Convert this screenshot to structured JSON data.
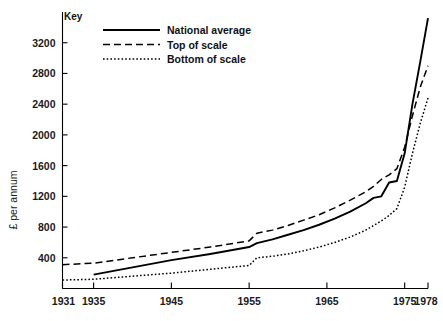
{
  "chart_data": {
    "type": "line",
    "title": "",
    "xlabel": "",
    "ylabel": "£ per annum",
    "xlim": [
      1931,
      1978
    ],
    "ylim": [
      0,
      3600
    ],
    "grid": false,
    "legend_title": "Key",
    "legend_position": "top-left-inside",
    "x_tick_labels": [
      "1931",
      "1935",
      "1945",
      "1955",
      "1965",
      "1975",
      "1978"
    ],
    "x_ticks": [
      1931,
      1935,
      1945,
      1955,
      1965,
      1975,
      1978
    ],
    "y_tick_labels": [
      "400",
      "800",
      "1200",
      "1600",
      "2000",
      "2400",
      "2800",
      "3200"
    ],
    "y_ticks": [
      400,
      800,
      1200,
      1600,
      2000,
      2400,
      2800,
      3200
    ],
    "series": [
      {
        "name": "National average",
        "style": "solid",
        "color": "#000000",
        "x": [
          1935,
          1940,
          1945,
          1950,
          1955,
          1956,
          1958,
          1960,
          1962,
          1964,
          1966,
          1968,
          1970,
          1971,
          1972,
          1973,
          1974,
          1975,
          1976,
          1977,
          1978
        ],
        "y": [
          180,
          275,
          370,
          450,
          540,
          590,
          640,
          700,
          760,
          830,
          910,
          1000,
          1110,
          1180,
          1200,
          1380,
          1400,
          1760,
          2400,
          2950,
          3520
        ]
      },
      {
        "name": "Top of scale",
        "style": "dashed",
        "color": "#000000",
        "x": [
          1931,
          1935,
          1940,
          1945,
          1950,
          1955,
          1956,
          1958,
          1960,
          1962,
          1964,
          1966,
          1968,
          1970,
          1971,
          1972,
          1973,
          1974,
          1975,
          1976,
          1977,
          1978
        ],
        "y": [
          310,
          330,
          400,
          470,
          540,
          620,
          720,
          760,
          820,
          890,
          960,
          1050,
          1150,
          1260,
          1330,
          1420,
          1480,
          1560,
          1840,
          2250,
          2620,
          2900
        ]
      },
      {
        "name": "Bottom of scale",
        "style": "dotted",
        "color": "#000000",
        "x": [
          1931,
          1935,
          1940,
          1945,
          1950,
          1955,
          1956,
          1958,
          1960,
          1962,
          1964,
          1966,
          1968,
          1970,
          1971,
          1972,
          1973,
          1974,
          1975,
          1976,
          1977,
          1978
        ],
        "y": [
          110,
          120,
          160,
          200,
          250,
          300,
          400,
          420,
          450,
          490,
          540,
          600,
          670,
          760,
          820,
          880,
          950,
          1040,
          1320,
          1760,
          2150,
          2480
        ]
      }
    ]
  },
  "legend": {
    "title": "Key",
    "items": [
      {
        "label": "National average",
        "style": "solid"
      },
      {
        "label": "Top of scale",
        "style": "dashed"
      },
      {
        "label": "Bottom of scale",
        "style": "dotted"
      }
    ]
  }
}
